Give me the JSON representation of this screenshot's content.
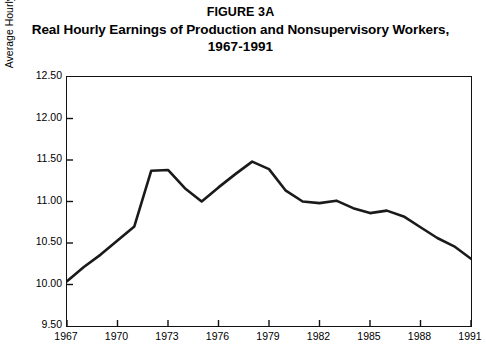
{
  "figure": {
    "title_line_1": "FIGURE 3A",
    "title_line_2": "Real Hourly Earnings of Production and Nonsupervisory Workers,",
    "title_line_3": "1967-1991"
  },
  "chart_data": {
    "type": "line",
    "title": "Real Hourly Earnings of Production and Nonsupervisory Workers, 1967-1991",
    "xlabel": "",
    "ylabel": "Average Hourly Earnings (1991 Dollars)",
    "xlim": [
      1967,
      1991
    ],
    "ylim": [
      9.5,
      12.5
    ],
    "ytick_labels": [
      "12.50",
      "12.00",
      "11.50",
      "11.00",
      "10.50",
      "10.00",
      "9.50"
    ],
    "ytick_values": [
      12.5,
      12.0,
      11.5,
      11.0,
      10.5,
      10.0,
      9.5
    ],
    "xtick_labels": [
      "1967",
      "1970",
      "1973",
      "1976",
      "1979",
      "1982",
      "1985",
      "1988",
      "1991"
    ],
    "xtick_values": [
      1967,
      1970,
      1973,
      1976,
      1979,
      1982,
      1985,
      1988,
      1991
    ],
    "grid": false,
    "legend": false,
    "line_color": "#1a1a1a",
    "line_width": 2.6,
    "x": [
      1967,
      1968,
      1969,
      1970,
      1971,
      1972,
      1973,
      1974,
      1975,
      1976,
      1977,
      1978,
      1979,
      1980,
      1981,
      1982,
      1983,
      1984,
      1985,
      1986,
      1987,
      1988,
      1989,
      1990,
      1991
    ],
    "values": [
      10.04,
      10.21,
      10.36,
      10.53,
      10.7,
      11.37,
      11.38,
      11.16,
      11.0,
      11.17,
      11.33,
      11.48,
      11.39,
      11.13,
      11.0,
      10.98,
      11.01,
      10.92,
      10.86,
      10.89,
      10.82,
      10.69,
      10.56,
      10.46,
      10.31
    ],
    "series": [
      {
        "name": "Average Hourly Earnings (1991 Dollars)",
        "values": [
          10.04,
          10.21,
          10.36,
          10.53,
          10.7,
          11.37,
          11.38,
          11.16,
          11.0,
          11.17,
          11.33,
          11.48,
          11.39,
          11.13,
          11.0,
          10.98,
          11.01,
          10.92,
          10.86,
          10.89,
          10.82,
          10.69,
          10.56,
          10.46,
          10.31
        ]
      }
    ]
  }
}
